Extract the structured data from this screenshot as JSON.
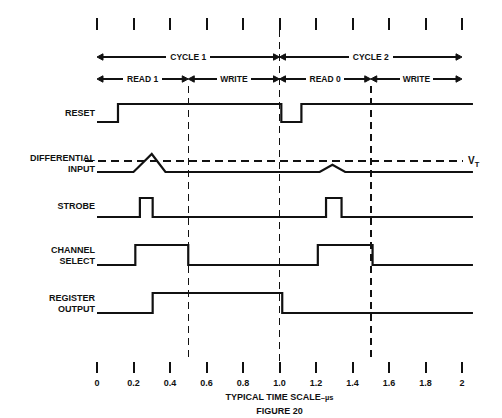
{
  "figure": {
    "caption": "FIGURE 20",
    "axis_title": "TYPICAL TIME SCALE",
    "axis_units": "–µs",
    "threshold_label": "V",
    "threshold_sub": "T"
  },
  "axis": {
    "ticks": [
      "0",
      "0.2",
      "0.4",
      "0.6",
      "0.8",
      "1.0",
      "1.2",
      "1.4",
      "1.6",
      "1.8",
      "2"
    ],
    "tick_values": [
      0,
      0.2,
      0.4,
      0.6,
      0.8,
      1.0,
      1.2,
      1.4,
      1.6,
      1.8,
      2.0
    ],
    "unit": "µs",
    "min": 0,
    "max": 2.0
  },
  "cycles": [
    {
      "label": "CYCLE 1",
      "start": 0.0,
      "end": 1.0
    },
    {
      "label": "CYCLE 2",
      "start": 1.0,
      "end": 2.0
    }
  ],
  "phases": [
    {
      "label": "READ 1",
      "start": 0.0,
      "end": 0.5
    },
    {
      "label": "WRITE",
      "start": 0.5,
      "end": 1.0
    },
    {
      "label": "READ 0",
      "start": 1.0,
      "end": 1.5
    },
    {
      "label": "WRITE",
      "start": 1.5,
      "end": 2.0
    }
  ],
  "markers": [
    0.5,
    1.0,
    1.5
  ],
  "signals": [
    {
      "name": "RESET",
      "label_lines": [
        "RESET"
      ],
      "kind": "digital",
      "transitions": [
        {
          "t": 0.0,
          "level": 0
        },
        {
          "t": 0.115,
          "level": 1
        },
        {
          "t": 1.01,
          "level": 0
        },
        {
          "t": 1.12,
          "level": 1
        },
        {
          "t": 2.06,
          "level": 1
        }
      ]
    },
    {
      "name": "DIFFERENTIAL INPUT",
      "label_lines": [
        "DIFFERENTIAL",
        "INPUT"
      ],
      "kind": "analog",
      "threshold": 0.62,
      "points": [
        {
          "t": 0.0,
          "a": 0.0
        },
        {
          "t": 0.2,
          "a": 0.0
        },
        {
          "t": 0.3,
          "a": 1.0
        },
        {
          "t": 0.375,
          "a": 0.0
        },
        {
          "t": 1.22,
          "a": 0.0
        },
        {
          "t": 1.29,
          "a": 0.4
        },
        {
          "t": 1.36,
          "a": 0.0
        },
        {
          "t": 2.06,
          "a": 0.0
        }
      ]
    },
    {
      "name": "STROBE",
      "label_lines": [
        "STROBE"
      ],
      "kind": "digital",
      "transitions": [
        {
          "t": 0.0,
          "level": 0
        },
        {
          "t": 0.235,
          "level": 1
        },
        {
          "t": 0.305,
          "level": 0
        },
        {
          "t": 1.255,
          "level": 1
        },
        {
          "t": 1.34,
          "level": 0
        },
        {
          "t": 2.06,
          "level": 0
        }
      ]
    },
    {
      "name": "CHANNEL SELECT",
      "label_lines": [
        "CHANNEL",
        "SELECT"
      ],
      "kind": "digital",
      "transitions": [
        {
          "t": 0.0,
          "level": 0
        },
        {
          "t": 0.21,
          "level": 1
        },
        {
          "t": 0.5,
          "level": 0
        },
        {
          "t": 1.21,
          "level": 1
        },
        {
          "t": 1.51,
          "level": 0
        },
        {
          "t": 2.06,
          "level": 0
        }
      ]
    },
    {
      "name": "REGISTER OUTPUT",
      "label_lines": [
        "REGISTER",
        "OUTPUT"
      ],
      "kind": "digital",
      "transitions": [
        {
          "t": 0.0,
          "level": 0
        },
        {
          "t": 0.305,
          "level": 1
        },
        {
          "t": 1.015,
          "level": 0
        },
        {
          "t": 2.06,
          "level": 0
        }
      ]
    }
  ],
  "colors": {
    "ink": "#111111",
    "background": "#ffffff"
  }
}
